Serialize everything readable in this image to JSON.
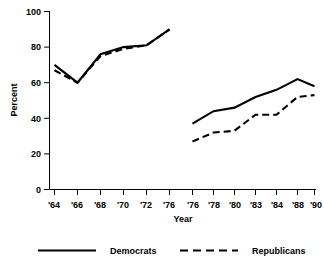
{
  "chart_data": {
    "type": "line",
    "title": "",
    "xlabel": "Year",
    "ylabel": "Percent",
    "ylim": [
      0,
      100
    ],
    "yticks": [
      0,
      20,
      40,
      60,
      80,
      100
    ],
    "grid": false,
    "legend_position": "bottom",
    "panels": [
      {
        "name": "left-panel",
        "categories": [
          "'64",
          "'66",
          "'68",
          "'70",
          "'72",
          "'76"
        ],
        "series": [
          {
            "name": "Democrats",
            "style": "solid",
            "values": [
              70,
              60,
              76,
              80,
              81,
              90
            ]
          },
          {
            "name": "Republicans",
            "style": "dashed",
            "values": [
              67,
              60,
              75,
              79,
              81,
              90
            ]
          }
        ]
      },
      {
        "name": "right-panel",
        "categories": [
          "'76",
          "'78",
          "'80",
          "'83",
          "'84",
          "'88",
          "'90"
        ],
        "series": [
          {
            "name": "Democrats",
            "style": "solid",
            "values": [
              37,
              44,
              46,
              52,
              56,
              62,
              58
            ]
          },
          {
            "name": "Republicans",
            "style": "dashed",
            "values": [
              27,
              32,
              33,
              42,
              42,
              52,
              53
            ]
          }
        ]
      }
    ],
    "legend": [
      {
        "label": "Democrats",
        "style": "solid"
      },
      {
        "label": "Republicans",
        "style": "dashed"
      }
    ]
  },
  "axis": {
    "y_title": "Percent",
    "x_title": "Year",
    "y_tick_labels": [
      "0",
      "20",
      "40",
      "60",
      "80",
      "100"
    ],
    "x_tick_labels_left": [
      "'64",
      "'66",
      "'68",
      "'70",
      "'72",
      "'76"
    ],
    "x_tick_labels_right": [
      "'76",
      "'78",
      "'80",
      "'83",
      "'84",
      "'88",
      "'90"
    ]
  },
  "legend": {
    "democrats_label": "Democrats",
    "republicans_label": "Republicans"
  },
  "colors": {
    "ink": "#000000",
    "background": "#ffffff"
  }
}
